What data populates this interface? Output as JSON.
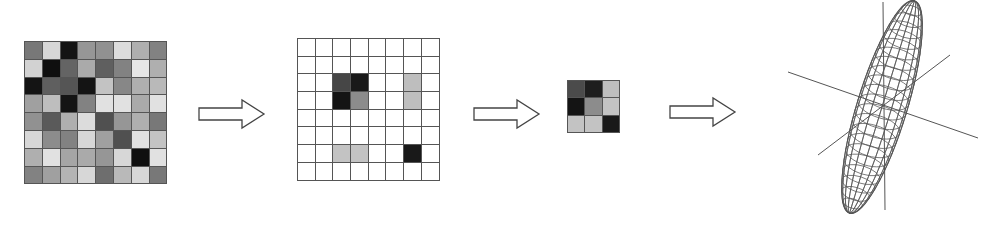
{
  "diagram": {
    "stages": [
      {
        "id": "dense-matrix",
        "type": "grid",
        "rows": 8,
        "cols": 8,
        "x": 24,
        "y": 41,
        "cell": 17.8,
        "values": [
          [
            120,
            215,
            20,
            150,
            145,
            220,
            175,
            130
          ],
          [
            210,
            15,
            100,
            170,
            95,
            130,
            230,
            175
          ],
          [
            20,
            95,
            85,
            20,
            195,
            135,
            175,
            185
          ],
          [
            160,
            190,
            20,
            130,
            225,
            225,
            170,
            225
          ],
          [
            145,
            90,
            175,
            220,
            80,
            150,
            175,
            120
          ],
          [
            215,
            140,
            130,
            215,
            160,
            80,
            225,
            195
          ],
          [
            175,
            225,
            165,
            170,
            150,
            215,
            15,
            225
          ],
          [
            130,
            160,
            180,
            215,
            110,
            185,
            215,
            120
          ]
        ]
      },
      {
        "id": "arrow-1",
        "type": "arrow",
        "x": 197,
        "y": 98
      },
      {
        "id": "sparse-matrix",
        "type": "grid",
        "rows": 8,
        "cols": 8,
        "x": 297,
        "y": 38,
        "cell": 17.7,
        "values": [
          [
            255,
            255,
            255,
            255,
            255,
            255,
            255,
            255
          ],
          [
            255,
            255,
            255,
            255,
            255,
            255,
            255,
            255
          ],
          [
            255,
            255,
            70,
            25,
            255,
            255,
            190,
            255
          ],
          [
            255,
            255,
            20,
            140,
            255,
            255,
            190,
            255
          ],
          [
            255,
            255,
            255,
            255,
            255,
            255,
            255,
            255
          ],
          [
            255,
            255,
            255,
            255,
            255,
            255,
            255,
            255
          ],
          [
            255,
            255,
            195,
            195,
            255,
            255,
            25,
            255
          ],
          [
            255,
            255,
            255,
            255,
            255,
            255,
            255,
            255
          ]
        ]
      },
      {
        "id": "arrow-2",
        "type": "arrow",
        "x": 472,
        "y": 98
      },
      {
        "id": "submatrix",
        "type": "grid",
        "rows": 3,
        "cols": 3,
        "x": 567,
        "y": 80,
        "cell": 17.3,
        "values": [
          [
            75,
            30,
            190
          ],
          [
            20,
            140,
            195
          ],
          [
            195,
            195,
            25
          ]
        ]
      },
      {
        "id": "arrow-3",
        "type": "arrow",
        "x": 668,
        "y": 96
      },
      {
        "id": "ellipsoid-3d",
        "type": "wireframe-ellipsoid",
        "center": [
          882,
          107
        ],
        "length": 222,
        "width": 50,
        "tilt_deg": 17,
        "axes": [
          [
            [
              788,
              72
            ],
            [
              978,
              138
            ]
          ],
          [
            [
              818,
              155
            ],
            [
              950,
              55
            ]
          ],
          [
            [
              883,
              2
            ],
            [
              885,
              210
            ]
          ]
        ]
      }
    ],
    "colors": {
      "grid_line": "#555555",
      "arrow_stroke": "#444444",
      "wire": "#555555",
      "axis": "#555555"
    }
  }
}
